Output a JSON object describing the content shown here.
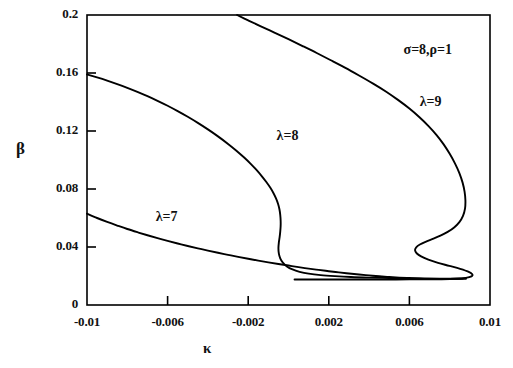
{
  "chart_data": {
    "type": "line",
    "title": "",
    "xlabel": "κ",
    "ylabel": "β",
    "xlim": [
      -0.01,
      0.01
    ],
    "ylim": [
      0,
      0.2
    ],
    "grid": false,
    "legend_position": "inline-curve-labels",
    "xticks": [
      -0.01,
      -0.006,
      -0.002,
      0.002,
      0.006,
      0.01
    ],
    "xticklabels": [
      "-0.01",
      "-0.006",
      "-0.002",
      "0.002",
      "0.006",
      "0.01"
    ],
    "yticks": [
      0,
      0.04,
      0.08,
      0.12,
      0.16,
      0.2
    ],
    "yticklabels": [
      "0",
      "0.04",
      "0.08",
      "0.12",
      "0.16",
      "0.2"
    ],
    "annotations": [
      {
        "name": "parameters",
        "text": "σ=8,ρ=1",
        "x": 0.0068,
        "y": 0.1745
      },
      {
        "name": "curve-label-lambda-9",
        "text": "λ=9",
        "x": 0.0076,
        "y": 0.1385
      },
      {
        "name": "curve-label-lambda-8",
        "text": "λ=8",
        "x": 0.0005,
        "y": 0.1155
      },
      {
        "name": "curve-label-lambda-7",
        "text": "λ=7",
        "x": -0.0055,
        "y": 0.0595
      }
    ],
    "series": [
      {
        "name": "λ=7",
        "label": "λ=7",
        "color": "#000000",
        "points": [
          [
            -0.01,
            0.063
          ],
          [
            -0.0095,
            0.06
          ],
          [
            -0.009,
            0.0573
          ],
          [
            -0.0085,
            0.0548
          ],
          [
            -0.008,
            0.0524
          ],
          [
            -0.0075,
            0.0502
          ],
          [
            -0.007,
            0.0481
          ],
          [
            -0.0065,
            0.0461
          ],
          [
            -0.006,
            0.0442
          ],
          [
            -0.0055,
            0.0424
          ],
          [
            -0.005,
            0.0407
          ],
          [
            -0.0045,
            0.0391
          ],
          [
            -0.004,
            0.0375
          ],
          [
            -0.0035,
            0.036
          ],
          [
            -0.003,
            0.0346
          ],
          [
            -0.0025,
            0.0332
          ],
          [
            -0.002,
            0.0319
          ],
          [
            -0.0015,
            0.0306
          ],
          [
            -0.001,
            0.0294
          ],
          [
            -0.0005,
            0.0283
          ],
          [
            0.0,
            0.0272
          ],
          [
            0.0005,
            0.0261
          ],
          [
            0.001,
            0.0251
          ],
          [
            0.0015,
            0.0242
          ],
          [
            0.002,
            0.0233
          ],
          [
            0.0025,
            0.0225
          ],
          [
            0.003,
            0.0217
          ],
          [
            0.0035,
            0.021
          ],
          [
            0.004,
            0.0204
          ],
          [
            0.0045,
            0.0198
          ],
          [
            0.005,
            0.0193
          ],
          [
            0.0055,
            0.0189
          ],
          [
            0.006,
            0.0186
          ],
          [
            0.0065,
            0.0183
          ],
          [
            0.007,
            0.0181
          ],
          [
            0.0075,
            0.018
          ],
          [
            0.008,
            0.018
          ],
          [
            0.0085,
            0.0181
          ],
          [
            0.0088,
            0.0183
          ]
        ]
      },
      {
        "name": "λ=8",
        "label": "λ=8",
        "color": "#000000",
        "points": [
          [
            -0.01,
            0.159
          ],
          [
            -0.0095,
            0.157
          ],
          [
            -0.009,
            0.1548
          ],
          [
            -0.0085,
            0.1524
          ],
          [
            -0.008,
            0.1498
          ],
          [
            -0.0075,
            0.147
          ],
          [
            -0.007,
            0.144
          ],
          [
            -0.0065,
            0.1408
          ],
          [
            -0.006,
            0.1374
          ],
          [
            -0.0055,
            0.1337
          ],
          [
            -0.005,
            0.1298
          ],
          [
            -0.0045,
            0.1256
          ],
          [
            -0.004,
            0.1211
          ],
          [
            -0.0035,
            0.1163
          ],
          [
            -0.003,
            0.1111
          ],
          [
            -0.0026,
            0.1066
          ],
          [
            -0.0022,
            0.1017
          ],
          [
            -0.0019,
            0.0977
          ],
          [
            -0.0016,
            0.0933
          ],
          [
            -0.0013,
            0.0884
          ],
          [
            -0.0011,
            0.0848
          ],
          [
            -0.0009,
            0.0808
          ],
          [
            -0.00075,
            0.0772
          ],
          [
            -0.00062,
            0.0735
          ],
          [
            -0.00052,
            0.0698
          ],
          [
            -0.00045,
            0.066
          ],
          [
            -0.00041,
            0.0622
          ],
          [
            -0.00039,
            0.0583
          ],
          [
            -0.00039,
            0.0545
          ],
          [
            -0.00041,
            0.0506
          ],
          [
            -0.00044,
            0.0468
          ],
          [
            -0.00048,
            0.043
          ],
          [
            -0.0005,
            0.0392
          ],
          [
            -0.00048,
            0.0356
          ],
          [
            -0.00041,
            0.0322
          ],
          [
            -0.00028,
            0.0292
          ],
          [
            -8e-05,
            0.0266
          ],
          [
            0.0002,
            0.0245
          ],
          [
            0.00055,
            0.0229
          ],
          [
            0.001,
            0.0216
          ],
          [
            0.0016,
            0.0206
          ],
          [
            0.0023,
            0.0199
          ],
          [
            0.0031,
            0.0193
          ],
          [
            0.004,
            0.0189
          ],
          [
            0.005,
            0.0186
          ],
          [
            0.006,
            0.0184
          ],
          [
            0.007,
            0.0182
          ],
          [
            0.0079,
            0.0181
          ],
          [
            0.0085,
            0.0181
          ],
          [
            0.0088,
            0.0182
          ]
        ]
      },
      {
        "name": "λ=9",
        "label": "λ=9",
        "color": "#000000",
        "points": [
          [
            -0.00255,
            0.2
          ],
          [
            -0.002,
            0.1963
          ],
          [
            -0.0014,
            0.1924
          ],
          [
            -0.0007,
            0.1879
          ],
          [
            0.0,
            0.1833
          ],
          [
            0.0007,
            0.1786
          ],
          [
            0.0014,
            0.1738
          ],
          [
            0.0021,
            0.1688
          ],
          [
            0.0028,
            0.1637
          ],
          [
            0.0035,
            0.1583
          ],
          [
            0.0042,
            0.1527
          ],
          [
            0.00485,
            0.1471
          ],
          [
            0.00545,
            0.1413
          ],
          [
            0.006,
            0.1355
          ],
          [
            0.0065,
            0.1295
          ],
          [
            0.00695,
            0.1234
          ],
          [
            0.00735,
            0.1172
          ],
          [
            0.0077,
            0.1108
          ],
          [
            0.008,
            0.1043
          ],
          [
            0.00826,
            0.0977
          ],
          [
            0.00848,
            0.091
          ],
          [
            0.00864,
            0.0844
          ],
          [
            0.00874,
            0.078
          ],
          [
            0.00878,
            0.072
          ],
          [
            0.00876,
            0.0665
          ],
          [
            0.00866,
            0.0615
          ],
          [
            0.00848,
            0.0572
          ],
          [
            0.00822,
            0.0535
          ],
          [
            0.0079,
            0.0504
          ],
          [
            0.00754,
            0.0478
          ],
          [
            0.00716,
            0.0456
          ],
          [
            0.0068,
            0.0436
          ],
          [
            0.00652,
            0.0417
          ],
          [
            0.00634,
            0.0398
          ],
          [
            0.00628,
            0.0378
          ],
          [
            0.00636,
            0.0357
          ],
          [
            0.00658,
            0.0335
          ],
          [
            0.00694,
            0.0313
          ],
          [
            0.00742,
            0.0291
          ],
          [
            0.00798,
            0.027
          ],
          [
            0.00852,
            0.0249
          ],
          [
            0.00892,
            0.023
          ],
          [
            0.00912,
            0.0212
          ],
          [
            0.00908,
            0.0197
          ],
          [
            0.0088,
            0.0187
          ],
          [
            0.0083,
            0.0181
          ],
          [
            0.0076,
            0.0178
          ],
          [
            0.0068,
            0.0177
          ],
          [
            0.006,
            0.0177
          ],
          [
            0.005,
            0.0176
          ],
          [
            0.004,
            0.0176
          ],
          [
            0.003,
            0.0176
          ],
          [
            0.002,
            0.0176
          ],
          [
            0.001,
            0.0176
          ],
          [
            0.0004,
            0.0176
          ],
          [
            0.0003,
            0.0176
          ]
        ]
      }
    ]
  }
}
